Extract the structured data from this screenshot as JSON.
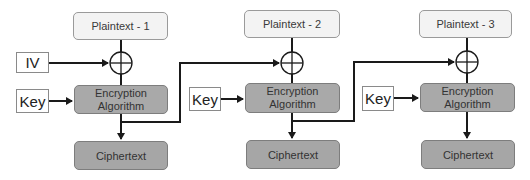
{
  "colors": {
    "plaintext_fill": "#f3f3f3",
    "algorithm_fill": "#a9a9a9",
    "ciphertext_fill": "#a6a6a6",
    "line": "#1a1a1a"
  },
  "iv": {
    "label": "IV"
  },
  "blocks": [
    {
      "plaintext": "Plaintext - 1",
      "key": "Key",
      "algorithm": "Encryption Algorithm",
      "ciphertext": "Ciphertext"
    },
    {
      "plaintext": "Plaintext - 2",
      "key": "Key",
      "algorithm": "Encryption Algorithm",
      "ciphertext": "Ciphertext"
    },
    {
      "plaintext": "Plaintext - 3",
      "key": "Key",
      "algorithm": "Encryption Algorithm",
      "ciphertext": "Ciphertext"
    }
  ]
}
